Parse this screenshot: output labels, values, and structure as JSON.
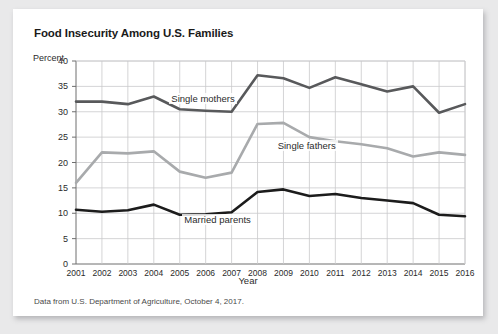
{
  "figure": {
    "title": "Food Insecurity Among U.S. Families",
    "source_note": "Data from U.S. Department of Agriculture, October 4, 2017."
  },
  "chart_data": {
    "type": "line",
    "title": "Food Insecurity Among U.S. Families",
    "xlabel": "Year",
    "ylabel": "Percent",
    "xlim": [
      2001,
      2016
    ],
    "ylim": [
      0,
      40
    ],
    "yticks": [
      0,
      5,
      10,
      15,
      20,
      25,
      30,
      35,
      40
    ],
    "grid": true,
    "legend_position": "inline-labels",
    "categories": [
      2001,
      2002,
      2003,
      2004,
      2005,
      2006,
      2007,
      2008,
      2009,
      2010,
      2011,
      2012,
      2013,
      2014,
      2015,
      2016
    ],
    "series": [
      {
        "name": "Single mothers",
        "color": "#58595b",
        "values": [
          32.0,
          32.0,
          31.5,
          33.0,
          30.5,
          30.2,
          30.0,
          37.2,
          36.6,
          34.7,
          36.8,
          35.4,
          34.0,
          35.0,
          29.8,
          31.5
        ]
      },
      {
        "name": "Single fathers",
        "color": "#a8aaac",
        "values": [
          16.0,
          22.0,
          21.8,
          22.2,
          18.2,
          17.0,
          18.0,
          27.6,
          27.8,
          25.0,
          24.2,
          23.6,
          22.8,
          21.2,
          22.0,
          21.5
        ]
      },
      {
        "name": "Married parents",
        "color": "#1c1c1c",
        "values": [
          10.7,
          10.3,
          10.6,
          11.7,
          9.7,
          9.8,
          10.2,
          14.2,
          14.7,
          13.4,
          13.8,
          13.0,
          12.5,
          12.0,
          9.7,
          9.4
        ]
      }
    ],
    "annotations": [
      {
        "text": "Single mothers",
        "x": 2004.6,
        "y": 32.6
      },
      {
        "text": "Single fathers",
        "x": 2008.7,
        "y": 23.2
      },
      {
        "text": "Married parents",
        "x": 2005.1,
        "y": 8.6
      }
    ]
  }
}
